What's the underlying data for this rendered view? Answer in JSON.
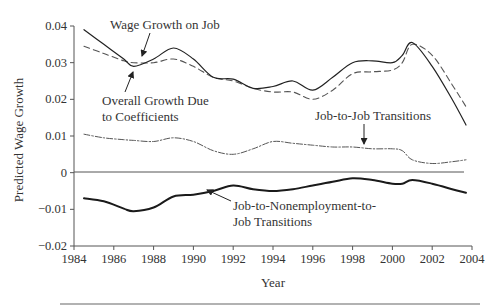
{
  "chart_data": {
    "type": "line",
    "title": "",
    "xlabel": "Year",
    "ylabel": "Predicted Wage Growth",
    "xlim": [
      1984,
      2004
    ],
    "ylim": [
      -0.02,
      0.04
    ],
    "grid": false,
    "legend": "none (inline annotations with arrows)",
    "x_ticks": [
      "1984",
      "1986",
      "1988",
      "1990",
      "1992",
      "1994",
      "1996",
      "1998",
      "2000",
      "2002",
      "2004"
    ],
    "y_ticks": [
      "0.04",
      "0.03",
      "0.02",
      "0.01",
      "0",
      "−0.01",
      "−0.02"
    ],
    "x": [
      1984.5,
      1985.5,
      1986.5,
      1987,
      1988,
      1989,
      1990,
      1991,
      1992,
      1993,
      1994,
      1995,
      1996,
      1997,
      1998,
      1999,
      2000,
      2000.5,
      2001,
      2002,
      2003,
      2003.7
    ],
    "series": [
      {
        "name": "Wage Growth on Job",
        "style": "dashed",
        "values": [
          0.0345,
          0.0325,
          0.0305,
          0.03,
          0.03,
          0.031,
          0.029,
          0.026,
          0.025,
          0.023,
          0.022,
          0.022,
          0.02,
          0.0225,
          0.027,
          0.0275,
          0.028,
          0.03,
          0.035,
          0.032,
          0.024,
          0.018
        ]
      },
      {
        "name": "Overall Growth Due to Coefficients",
        "style": "solid",
        "values": [
          0.039,
          0.035,
          0.031,
          0.029,
          0.031,
          0.034,
          0.031,
          0.026,
          0.0255,
          0.023,
          0.0235,
          0.025,
          0.0225,
          0.026,
          0.03,
          0.0305,
          0.03,
          0.032,
          0.0355,
          0.029,
          0.02,
          0.013
        ]
      },
      {
        "name": "Job-to-Job Transitions",
        "style": "dash-dot",
        "values": [
          0.0105,
          0.0095,
          0.009,
          0.0088,
          0.0085,
          0.0095,
          0.0085,
          0.006,
          0.005,
          0.0065,
          0.0085,
          0.008,
          0.0075,
          0.007,
          0.007,
          0.0065,
          0.0065,
          0.006,
          0.0035,
          0.0025,
          0.003,
          0.0035
        ]
      },
      {
        "name": "Job-to-Nonemployment-to-Job Transitions",
        "style": "thick-solid",
        "values": [
          -0.007,
          -0.0078,
          -0.0098,
          -0.0105,
          -0.0095,
          -0.0065,
          -0.006,
          -0.005,
          -0.0035,
          -0.0045,
          -0.005,
          -0.0045,
          -0.0035,
          -0.0025,
          -0.0015,
          -0.002,
          -0.003,
          -0.003,
          -0.002,
          -0.003,
          -0.0045,
          -0.0055
        ]
      }
    ],
    "annotations": [
      {
        "text": "Wage Growth on Job",
        "points_to": "Wage Growth on Job"
      },
      {
        "text": "Overall Growth Due to Coefficients",
        "lines": [
          "Overall Growth Due",
          "to Coefficients"
        ],
        "points_to": "Overall Growth Due to Coefficients"
      },
      {
        "text": "Job-to-Job Transitions",
        "points_to": "Job-to-Job Transitions"
      },
      {
        "text": "Job-to-Nonemployment-to-Job Transitions",
        "lines": [
          "Job-to-Nonemployment-to-",
          "Job Transitions"
        ],
        "points_to": "Job-to-Nonemployment-to-Job Transitions"
      }
    ]
  },
  "labels": {
    "xlabel": "Year",
    "ylabel": "Predicted Wage Growth",
    "annot_wage": "Wage Growth on Job",
    "annot_overall_1": "Overall Growth Due",
    "annot_overall_2": "to Coefficients",
    "annot_j2j": "Job-to-Job Transitions",
    "annot_j2n2j_1": "Job-to-Nonemployment-to-",
    "annot_j2n2j_2": "Job Transitions"
  }
}
